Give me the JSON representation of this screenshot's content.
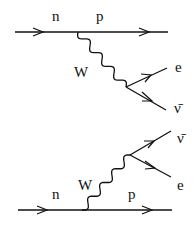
{
  "diagrams": [
    {
      "name": "decay-diagram",
      "labels": {
        "incoming": "n",
        "outgoing": "p",
        "boson": "W",
        "lepton": "e",
        "antineutrino": "ν̄"
      }
    },
    {
      "name": "inverse-diagram",
      "labels": {
        "incoming": "n",
        "outgoing": "p",
        "boson": "W",
        "lepton": "e",
        "antineutrino": "ν̄"
      }
    }
  ]
}
